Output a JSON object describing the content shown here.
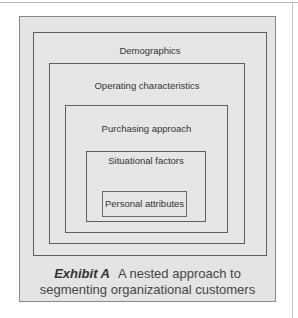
{
  "diagram": {
    "type": "nested-boxes",
    "layers": [
      {
        "level": 1,
        "label": "Demographics"
      },
      {
        "level": 2,
        "label": "Operating characteristics"
      },
      {
        "level": 3,
        "label": "Purchasing approach"
      },
      {
        "level": 4,
        "label": "Situational factors"
      },
      {
        "level": 5,
        "label": "Personal attributes"
      }
    ],
    "caption": {
      "exhibit_label": "Exhibit A",
      "line1": "A nested approach to",
      "line2": "segmenting organizational customers"
    },
    "colors": {
      "panel_bg": "#e4e4e4",
      "border": "#5e5e5e",
      "text": "#333333"
    }
  }
}
